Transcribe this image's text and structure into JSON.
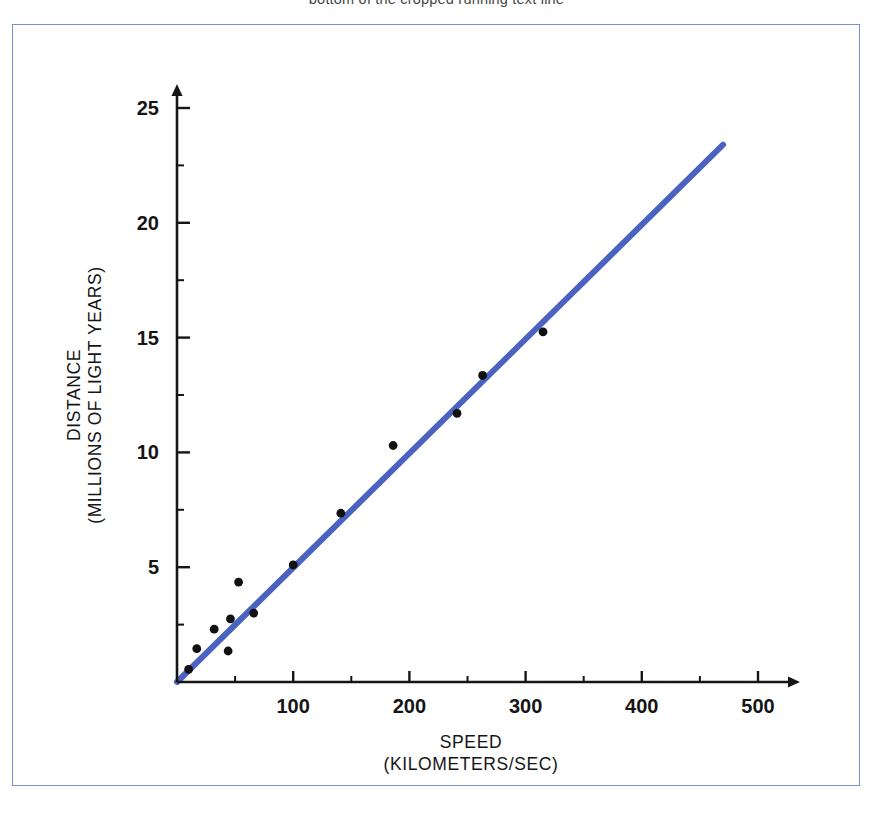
{
  "page": {
    "top_text_fragment": "bottom of the cropped running text line",
    "frame_color": "#7f8fd6",
    "background": "#ffffff"
  },
  "chart_data": {
    "type": "scatter",
    "title": "",
    "subtitle": "",
    "xlabel": "SPEED",
    "xlabel_units": "(KILOMETERS/SEC)",
    "ylabel": "DISTANCE",
    "ylabel_units": "(MILLIONS OF LIGHT YEARS)",
    "xlim": [
      0,
      530
    ],
    "ylim": [
      0,
      26
    ],
    "xticks": [
      100,
      200,
      300,
      400,
      500
    ],
    "xtick_labels": [
      "100",
      "200",
      "300",
      "400",
      "500"
    ],
    "x_minor_ticks": [
      50,
      150,
      250,
      350,
      450
    ],
    "yticks": [
      5,
      10,
      15,
      20,
      25
    ],
    "ytick_labels": [
      "5",
      "10",
      "15",
      "20",
      "25"
    ],
    "y_minor_ticks": [
      2.5,
      7.5,
      12.5,
      17.5,
      22.5
    ],
    "grid": false,
    "legend": "none",
    "point_color": "#111111",
    "point_radius": 4.4,
    "line_color": "#4a62c0",
    "line_width": 6,
    "axis_color": "#151515",
    "points": [
      {
        "x": 10,
        "y": 0.55
      },
      {
        "x": 17,
        "y": 1.45
      },
      {
        "x": 32,
        "y": 2.3
      },
      {
        "x": 44,
        "y": 1.35
      },
      {
        "x": 46,
        "y": 2.75
      },
      {
        "x": 53,
        "y": 4.35
      },
      {
        "x": 66,
        "y": 3.0
      },
      {
        "x": 100,
        "y": 5.1
      },
      {
        "x": 141,
        "y": 7.35
      },
      {
        "x": 186,
        "y": 10.3
      },
      {
        "x": 241,
        "y": 11.7
      },
      {
        "x": 263,
        "y": 13.35
      },
      {
        "x": 315,
        "y": 15.25
      }
    ],
    "fit_line": {
      "name": "linear fit through origin",
      "x_start": 0,
      "y_start": 0,
      "x_end": 470,
      "y_end": 23.4
    }
  }
}
